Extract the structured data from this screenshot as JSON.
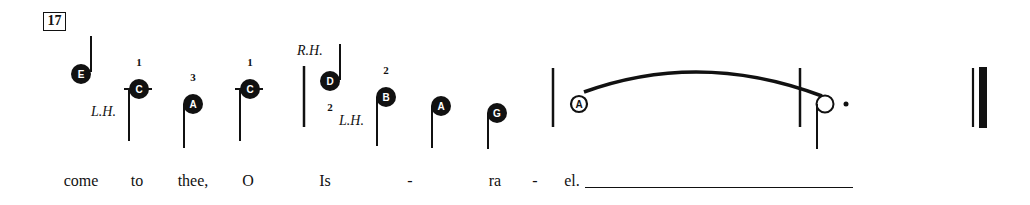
{
  "measure_number": "17",
  "colors": {
    "ink": "#111111",
    "paper": "#ffffff"
  },
  "notes": [
    {
      "id": "n1",
      "letter": "E",
      "finger": "",
      "stem": "up",
      "filled": true
    },
    {
      "id": "n2",
      "letter": "C",
      "finger": "1",
      "stem": "down",
      "filled": true,
      "ledger": true
    },
    {
      "id": "n3",
      "letter": "A",
      "finger": "3",
      "stem": "down",
      "filled": true
    },
    {
      "id": "n4",
      "letter": "C",
      "finger": "1",
      "stem": "down",
      "filled": true,
      "ledger": true
    },
    {
      "id": "n5",
      "letter": "D",
      "finger": "2",
      "stem": "up",
      "filled": true
    },
    {
      "id": "n6",
      "letter": "B",
      "finger": "2",
      "stem": "down",
      "filled": true
    },
    {
      "id": "n7",
      "letter": "A",
      "finger": "",
      "stem": "down",
      "filled": true
    },
    {
      "id": "n8",
      "letter": "G",
      "finger": "",
      "stem": "down",
      "filled": true
    },
    {
      "id": "n9",
      "letter": "A",
      "finger": "",
      "stem": "none",
      "filled": false,
      "tied": true
    },
    {
      "id": "n10",
      "letter": "",
      "finger": "",
      "stem": "down",
      "filled": false,
      "dotted": true,
      "duration": "dotted-half"
    }
  ],
  "hand_markings": [
    {
      "label": "L.H."
    },
    {
      "label": "R.H."
    },
    {
      "label": "L.H."
    }
  ],
  "lyrics": [
    {
      "text": "come"
    },
    {
      "text": "to"
    },
    {
      "text": "thee,"
    },
    {
      "text": "O"
    },
    {
      "text": "Is"
    },
    {
      "text": "-"
    },
    {
      "text": "ra"
    },
    {
      "text": "-"
    },
    {
      "text": "el."
    }
  ],
  "barlines": [
    "single",
    "single",
    "single",
    "final"
  ]
}
